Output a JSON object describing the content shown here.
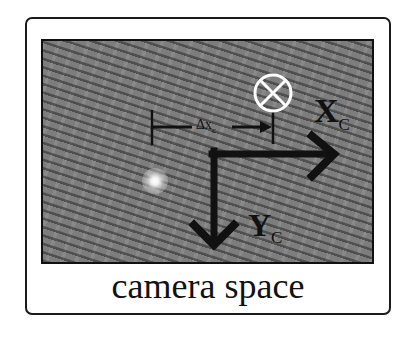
{
  "figure": {
    "caption": "camera space",
    "axes": {
      "x_axis": {
        "label": "X",
        "subscript": "C"
      },
      "y_axis": {
        "label": "Y",
        "subscript": "C"
      }
    },
    "offset": {
      "label": "Δx",
      "subscript": "c"
    },
    "symbols": {
      "into_page": "otimes-icon",
      "light_spot": "bright-spot"
    },
    "colors": {
      "background": "#ffffff",
      "photo_gray": "#7d7d7d",
      "ink": "#111111",
      "symbol": "#ffffff"
    }
  }
}
